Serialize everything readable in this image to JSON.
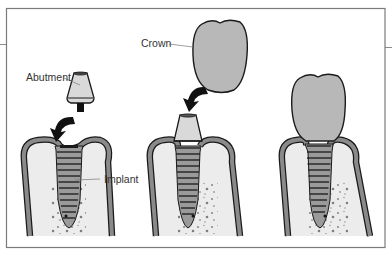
{
  "diagram": {
    "title": "",
    "panels": [
      {
        "id": "step-1",
        "description": "Abutment placed onto implant in bone"
      },
      {
        "id": "step-2",
        "description": "Crown placed onto abutment"
      },
      {
        "id": "step-3",
        "description": "Completed implant with crown"
      }
    ],
    "labels": {
      "abutment": "Abutment",
      "crown": "Crown",
      "implant": "Implant"
    },
    "colors": {
      "frame": "#7a7a7a",
      "outline": "#1a1a1a",
      "gum": "#8a8a8a",
      "bone_fill": "#ececec",
      "crown_fill": "#b8b8b8",
      "abutment_fill": "#d9d9d9",
      "implant_fill": "#9a9a9a",
      "arrow": "#111111"
    }
  }
}
